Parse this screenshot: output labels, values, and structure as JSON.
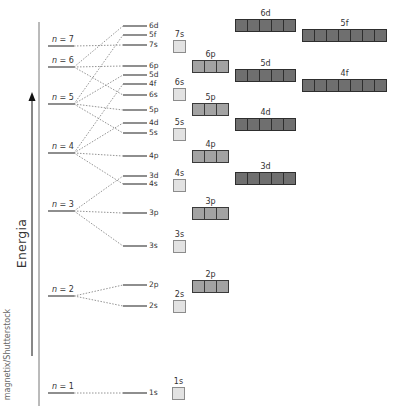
{
  "axis": {
    "label": "Energia",
    "credit": "magnetix/Shutterstock"
  },
  "shells": [
    {
      "n": "7",
      "label": "n = 7",
      "y": 46
    },
    {
      "n": "6",
      "label": "n = 6",
      "y": 67
    },
    {
      "n": "5",
      "label": "n = 5",
      "y": 104
    },
    {
      "n": "4",
      "label": "n = 4",
      "y": 153
    },
    {
      "n": "3",
      "label": "n = 3",
      "y": 211
    },
    {
      "n": "2",
      "label": "n = 2",
      "y": 296
    },
    {
      "n": "1",
      "label": "n = 1",
      "y": 393
    }
  ],
  "levels": [
    {
      "label": "6d",
      "y": 26,
      "from": "6"
    },
    {
      "label": "5f",
      "y": 35,
      "from": "5"
    },
    {
      "label": "7s",
      "y": 45,
      "from": "7"
    },
    {
      "label": "6p",
      "y": 66,
      "from": "6"
    },
    {
      "label": "5d",
      "y": 75,
      "from": "5"
    },
    {
      "label": "4f",
      "y": 84,
      "from": "4"
    },
    {
      "label": "6s",
      "y": 95,
      "from": "6"
    },
    {
      "label": "5p",
      "y": 110,
      "from": "5"
    },
    {
      "label": "4d",
      "y": 123,
      "from": "4"
    },
    {
      "label": "5s",
      "y": 133,
      "from": "5"
    },
    {
      "label": "4p",
      "y": 156,
      "from": "4"
    },
    {
      "label": "3d",
      "y": 176,
      "from": "3"
    },
    {
      "label": "4s",
      "y": 184,
      "from": "4"
    },
    {
      "label": "3p",
      "y": 213,
      "from": "3"
    },
    {
      "label": "3s",
      "y": 246,
      "from": "3"
    },
    {
      "label": "2p",
      "y": 285,
      "from": "2"
    },
    {
      "label": "2s",
      "y": 306,
      "from": "2"
    },
    {
      "label": "1s",
      "y": 393,
      "from": "1"
    }
  ],
  "orbitals": [
    {
      "label": "7s",
      "type": "s",
      "count": 1,
      "x": 173,
      "y": 40
    },
    {
      "label": "6s",
      "type": "s",
      "count": 1,
      "x": 173,
      "y": 88
    },
    {
      "label": "5s",
      "type": "s",
      "count": 1,
      "x": 173,
      "y": 128
    },
    {
      "label": "4s",
      "type": "s",
      "count": 1,
      "x": 173,
      "y": 179
    },
    {
      "label": "3s",
      "type": "s",
      "count": 1,
      "x": 173,
      "y": 240
    },
    {
      "label": "2s",
      "type": "s",
      "count": 1,
      "x": 173,
      "y": 300
    },
    {
      "label": "1s",
      "type": "s",
      "count": 1,
      "x": 172,
      "y": 387
    },
    {
      "label": "6p",
      "type": "p",
      "count": 3,
      "x": 192,
      "y": 60
    },
    {
      "label": "5p",
      "type": "p",
      "count": 3,
      "x": 192,
      "y": 103
    },
    {
      "label": "4p",
      "type": "p",
      "count": 3,
      "x": 192,
      "y": 150
    },
    {
      "label": "3p",
      "type": "p",
      "count": 3,
      "x": 192,
      "y": 207
    },
    {
      "label": "2p",
      "type": "p",
      "count": 3,
      "x": 192,
      "y": 280
    },
    {
      "label": "6d",
      "type": "d",
      "count": 5,
      "x": 235,
      "y": 19
    },
    {
      "label": "5d",
      "type": "d",
      "count": 5,
      "x": 235,
      "y": 69
    },
    {
      "label": "4d",
      "type": "d",
      "count": 5,
      "x": 235,
      "y": 118
    },
    {
      "label": "3d",
      "type": "d",
      "count": 5,
      "x": 235,
      "y": 172
    },
    {
      "label": "5f",
      "type": "f",
      "count": 7,
      "x": 302,
      "y": 29
    },
    {
      "label": "4f",
      "type": "f",
      "count": 7,
      "x": 302,
      "y": 79
    }
  ],
  "colors": {
    "s_fill": "#e2e2e2",
    "p_fill": "#a3a3a3",
    "df_fill": "#6f6f6f",
    "line": "#555555",
    "dotted": "#888888"
  }
}
